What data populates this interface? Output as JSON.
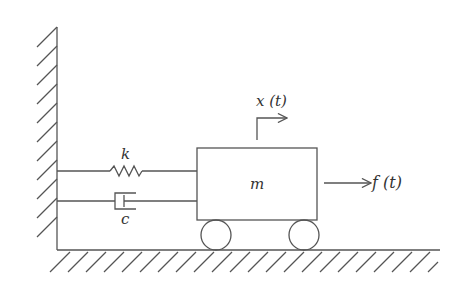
{
  "diagram": {
    "colors": {
      "line": "#555555",
      "background": "#ffffff"
    },
    "labels": {
      "spring": "k",
      "damper": "c",
      "mass": "m",
      "displacement": "x (t)",
      "force": "f (t)"
    },
    "components": [
      "wall",
      "floor",
      "spring",
      "damper",
      "mass",
      "wheel-left",
      "wheel-right",
      "displacement-arrow",
      "force-arrow"
    ]
  }
}
